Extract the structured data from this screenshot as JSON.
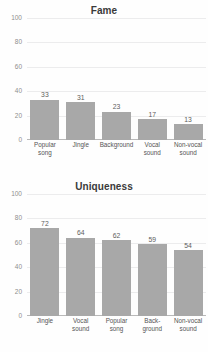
{
  "figure": {
    "background_color": "#fefefe",
    "bar_color": "#a8a8a8",
    "gridline_color": "#ececed",
    "axis_color": "#b9b9b9",
    "tick_label_color": "#8e8e8e",
    "value_label_color": "#5d5d5d"
  },
  "chart_data": [
    {
      "type": "bar",
      "title": "Fame",
      "xlabel": "",
      "ylabel": "",
      "ylim": [
        0,
        100
      ],
      "yticks": [
        0,
        20,
        40,
        60,
        80,
        100
      ],
      "grid": true,
      "legend": "none",
      "categories": [
        "Popular song",
        "Jingle",
        "Background",
        "Vocal sound",
        "Non-vocal sound"
      ],
      "category_lines": [
        [
          "Popular",
          "song"
        ],
        [
          "Jingle"
        ],
        [
          "Background"
        ],
        [
          "Vocal",
          "sound"
        ],
        [
          "Non-vocal",
          "sound"
        ]
      ],
      "values": [
        33,
        31,
        23,
        17,
        13
      ],
      "data_labels": [
        "33",
        "31",
        "23",
        "17",
        "13"
      ]
    },
    {
      "type": "bar",
      "title": "Uniqueness",
      "xlabel": "",
      "ylabel": "",
      "ylim": [
        0,
        100
      ],
      "yticks": [
        0,
        20,
        40,
        60,
        80,
        100
      ],
      "grid": true,
      "legend": "none",
      "categories": [
        "Jingle",
        "Vocal sound",
        "Popular song",
        "Back-ground",
        "Non-vocal sound"
      ],
      "category_lines": [
        [
          "Jingle"
        ],
        [
          "Vocal",
          "sound"
        ],
        [
          "Popular",
          "song"
        ],
        [
          "Back-",
          "ground"
        ],
        [
          "Non-vocal",
          "sound"
        ]
      ],
      "values": [
        72,
        64,
        62,
        59,
        54
      ],
      "data_labels": [
        "72",
        "64",
        "62",
        "59",
        "54"
      ]
    }
  ]
}
